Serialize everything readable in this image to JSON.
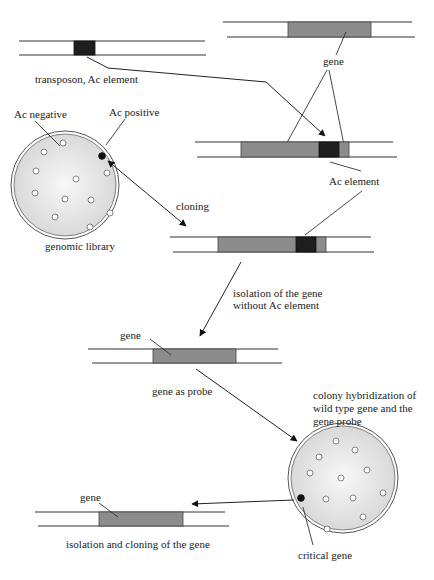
{
  "diagram": {
    "type": "process-flow",
    "topic": "Transposon tagging: isolation of a gene using the Ac element",
    "colors": {
      "gene": "#8c8c8c",
      "ac_element": "#1e1e1e",
      "dish_fill": "#e2e2e2",
      "strand": "#333333",
      "positive_colony": "#111111",
      "negative_colony": "#ffffff"
    },
    "labels": {
      "transposon": "transposon, Ac element",
      "gene_top": "gene",
      "ac_element": "Ac element",
      "ac_negative": "Ac negative",
      "ac_positive": "Ac positive",
      "genomic_library": "genomic library",
      "cloning": "cloning",
      "isolation_line1": "isolation of the gene",
      "isolation_line2": "without Ac element",
      "gene_probe_dna": "gene",
      "gene_as_probe": "gene as probe",
      "hybridization_line1": "colony hybridization of",
      "hybridization_line2": "wild type gene and the",
      "hybridization_line3": "gene probe",
      "critical_gene": "critical gene",
      "gene_final": "gene",
      "final_step": "isolation and cloning of the gene"
    },
    "dishes": [
      {
        "name": "genomic library",
        "colonies_negative": 11,
        "colonies_positive": 1
      },
      {
        "name": "colony hybridization",
        "colonies_negative": 12,
        "colonies_positive": 1
      }
    ]
  }
}
